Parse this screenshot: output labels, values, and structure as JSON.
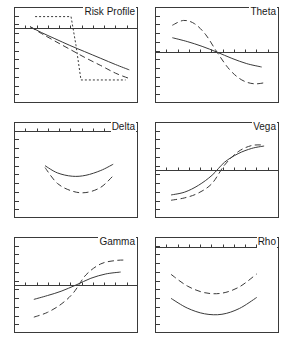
{
  "figure": {
    "width": 286,
    "height": 340,
    "background": "#ffffff",
    "stroke_color": "#3a3a3a",
    "rows": 3,
    "cols": 2
  },
  "panels": [
    {
      "id": "risk-profile",
      "title": "Risk Profile",
      "row": 0,
      "col": 0,
      "x_ticks": 10,
      "y_ticks": 10,
      "axis_y_fraction": 0.22
    },
    {
      "id": "theta",
      "title": "Theta",
      "row": 0,
      "col": 1,
      "x_ticks": 10,
      "y_ticks": 10,
      "axis_y_fraction": 0.47
    },
    {
      "id": "delta",
      "title": "Delta",
      "row": 1,
      "col": 0,
      "x_ticks": 10,
      "y_ticks": 10,
      "axis_y_fraction": 0.09
    },
    {
      "id": "vega",
      "title": "Vega",
      "row": 1,
      "col": 1,
      "x_ticks": 10,
      "y_ticks": 10,
      "axis_y_fraction": 0.5
    },
    {
      "id": "gamma",
      "title": "Gamma",
      "row": 2,
      "col": 0,
      "x_ticks": 10,
      "y_ticks": 10,
      "axis_y_fraction": 0.5
    },
    {
      "id": "rho",
      "title": "Rho",
      "row": 2,
      "col": 1,
      "x_ticks": 10,
      "y_ticks": 10,
      "axis_y_fraction": 0.1
    }
  ],
  "chart_data": {
    "type": "line",
    "xlabel": "Underlying price",
    "ylabel": "Value",
    "xlim": [
      0,
      1
    ],
    "ylim": [
      0,
      1
    ],
    "grid": false,
    "legend": null,
    "panels": [
      {
        "name": "Risk Profile",
        "axis_y": 0.22,
        "series": [
          {
            "name": "current",
            "style": "solid",
            "x": [
              0.13,
              0.22,
              0.33,
              0.45,
              0.57,
              0.7,
              0.82,
              0.93
            ],
            "y": [
              0.205,
              0.265,
              0.33,
              0.4,
              0.465,
              0.535,
              0.6,
              0.655
            ]
          },
          {
            "name": "intermediate",
            "style": "dashed",
            "x": [
              0.13,
              0.22,
              0.33,
              0.45,
              0.57,
              0.7,
              0.82,
              0.93
            ],
            "y": [
              0.205,
              0.275,
              0.355,
              0.44,
              0.525,
              0.61,
              0.69,
              0.745
            ]
          },
          {
            "name": "expiry",
            "style": "dotted",
            "x": [
              0.17,
              0.46,
              0.5,
              0.54,
              0.9
            ],
            "y": [
              0.1,
              0.1,
              0.4,
              0.76,
              0.76
            ]
          }
        ]
      },
      {
        "name": "Theta",
        "axis_y": 0.47,
        "series": [
          {
            "name": "current",
            "style": "solid",
            "x": [
              0.14,
              0.26,
              0.38,
              0.5,
              0.62,
              0.74,
              0.86
            ],
            "y": [
              0.32,
              0.36,
              0.41,
              0.47,
              0.535,
              0.59,
              0.625
            ]
          },
          {
            "name": "expiry",
            "style": "dashed",
            "x": [
              0.14,
              0.23,
              0.32,
              0.41,
              0.5,
              0.6,
              0.7,
              0.8,
              0.9
            ],
            "y": [
              0.19,
              0.14,
              0.175,
              0.29,
              0.47,
              0.65,
              0.76,
              0.8,
              0.785
            ]
          }
        ]
      },
      {
        "name": "Delta",
        "axis_y": 0.09,
        "series": [
          {
            "name": "current",
            "style": "solid",
            "x": [
              0.25,
              0.35,
              0.47,
              0.58,
              0.7,
              0.8
            ],
            "y": [
              0.455,
              0.53,
              0.565,
              0.555,
              0.505,
              0.44
            ]
          },
          {
            "name": "expiry",
            "style": "dashed",
            "x": [
              0.25,
              0.35,
              0.47,
              0.58,
              0.7,
              0.8
            ],
            "y": [
              0.475,
              0.64,
              0.72,
              0.735,
              0.68,
              0.56
            ]
          }
        ]
      },
      {
        "name": "Vega",
        "axis_y": 0.5,
        "series": [
          {
            "name": "current",
            "style": "solid",
            "x": [
              0.13,
              0.24,
              0.35,
              0.46,
              0.56,
              0.67,
              0.78,
              0.88
            ],
            "y": [
              0.76,
              0.73,
              0.66,
              0.555,
              0.42,
              0.33,
              0.275,
              0.25
            ]
          },
          {
            "name": "expiry",
            "style": "dashed",
            "x": [
              0.13,
              0.24,
              0.35,
              0.46,
              0.56,
              0.67,
              0.78,
              0.88
            ],
            "y": [
              0.815,
              0.79,
              0.74,
              0.64,
              0.45,
              0.31,
              0.245,
              0.24
            ]
          }
        ]
      },
      {
        "name": "Gamma",
        "axis_y": 0.5,
        "series": [
          {
            "name": "current",
            "style": "solid",
            "x": [
              0.16,
              0.27,
              0.38,
              0.5,
              0.62,
              0.74,
              0.86
            ],
            "y": [
              0.65,
              0.61,
              0.565,
              0.5,
              0.43,
              0.385,
              0.365
            ]
          },
          {
            "name": "expiry",
            "style": "dashed",
            "x": [
              0.16,
              0.27,
              0.38,
              0.48,
              0.58,
              0.7,
              0.82,
              0.9
            ],
            "y": [
              0.835,
              0.785,
              0.7,
              0.58,
              0.395,
              0.28,
              0.245,
              0.24
            ]
          }
        ]
      },
      {
        "name": "Rho",
        "axis_y": 0.1,
        "series": [
          {
            "name": "current",
            "style": "solid",
            "x": [
              0.13,
              0.26,
              0.4,
              0.54,
              0.68,
              0.82
            ],
            "y": [
              0.64,
              0.74,
              0.8,
              0.805,
              0.745,
              0.63
            ]
          },
          {
            "name": "expiry",
            "style": "dashed",
            "x": [
              0.13,
              0.26,
              0.4,
              0.54,
              0.68,
              0.82
            ],
            "y": [
              0.39,
              0.51,
              0.58,
              0.585,
              0.52,
              0.385
            ]
          }
        ]
      }
    ]
  }
}
